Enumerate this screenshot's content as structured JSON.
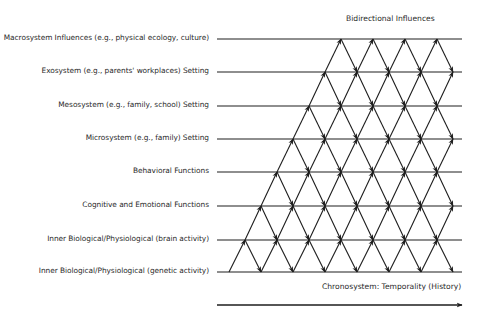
{
  "diagram": {
    "title": "Bidirectional Influences",
    "time_axis_label": "Chronosystem: Temporality (History)",
    "levels": [
      {
        "label": "Macrosystem Influences (e.g., physical ecology, culture)",
        "y": 39
      },
      {
        "label": "Exosystem (e.g., parents' workplaces) Setting",
        "y": 72
      },
      {
        "label": "Mesosystem (e.g., family, school) Setting",
        "y": 106
      },
      {
        "label": "Microsystem (e.g., family) Setting",
        "y": 139
      },
      {
        "label": "Behavioral Functions",
        "y": 172
      },
      {
        "label": "Cognitive and Emotional Functions",
        "y": 206
      },
      {
        "label": "Inner Biological/Physiological (brain activity)",
        "y": 240
      },
      {
        "label": "Inner Biological/Physiological (genetic activity)",
        "y": 272
      }
    ],
    "lattice": {
      "line_x_start": 217,
      "line_x_end": 462,
      "origin_x": 229,
      "half_step": 16,
      "right_limit": 455,
      "stroke_color": "#1e1e1e"
    },
    "time_arrow": {
      "y": 305,
      "x_start": 217,
      "x_end": 462
    }
  }
}
